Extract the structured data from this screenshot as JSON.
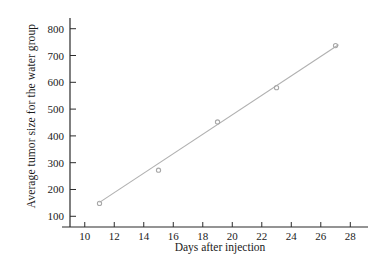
{
  "chart_data": {
    "type": "scatter",
    "title": "",
    "xlabel": "Days after injection",
    "ylabel": "Average tumor size for the water group",
    "xlim": [
      9.0,
      29.2
    ],
    "ylim": [
      60,
      840
    ],
    "xticks": [
      10,
      12,
      14,
      16,
      18,
      20,
      22,
      24,
      26,
      28
    ],
    "xtick_labels": [
      "10",
      "12",
      "14",
      "16",
      "18",
      "20",
      "22",
      "24",
      "26",
      "28"
    ],
    "yticks": [
      100,
      200,
      300,
      400,
      500,
      600,
      700,
      800
    ],
    "ytick_labels": [
      "100",
      "200",
      "300",
      "400",
      "500",
      "600",
      "700",
      "800"
    ],
    "grid": false,
    "legend": null,
    "x": [
      11,
      15,
      19,
      23,
      27
    ],
    "y": [
      148,
      272,
      452,
      580,
      737
    ],
    "points": [
      {
        "x": 11,
        "y": 148
      },
      {
        "x": 15,
        "y": 272
      },
      {
        "x": 19,
        "y": 452
      },
      {
        "x": 23,
        "y": 580
      },
      {
        "x": 27,
        "y": 737
      }
    ],
    "series": [
      {
        "name": "water group tumor size",
        "marker": "open-circle",
        "color": "#a8a8a8",
        "values": [
          148,
          272,
          452,
          580,
          737
        ]
      }
    ],
    "trendline": {
      "type": "linear",
      "color": "#b0b0b0",
      "x_start": 11,
      "y_start": 152,
      "x_end": 27.2,
      "y_end": 740
    },
    "colors": {
      "axis": "#2b2b2b",
      "line": "#b0b0b0",
      "marker": "#a8a8a8",
      "text": "#1a1a1a",
      "background": "#ffffff"
    }
  }
}
